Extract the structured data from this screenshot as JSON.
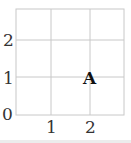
{
  "grid": {
    "x_ticks": [
      "1",
      "2"
    ],
    "y_ticks": [
      "0",
      "1",
      "2"
    ],
    "cols": 3,
    "rows": 3,
    "line_color": "#c8c8c8"
  },
  "points": [
    {
      "label": "A",
      "x": 2,
      "y": 1
    }
  ]
}
